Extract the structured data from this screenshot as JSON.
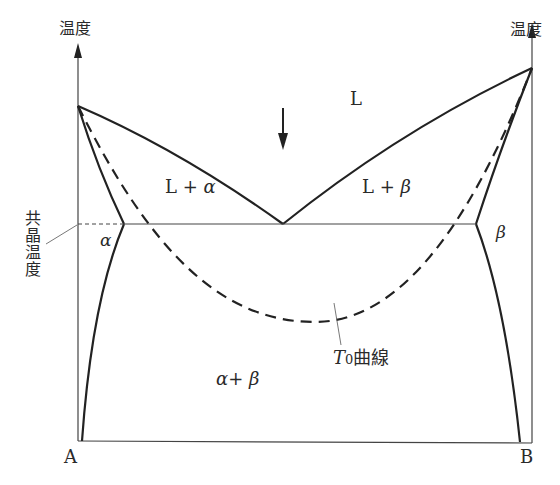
{
  "axes": {
    "left_axis_label": "温度",
    "right_axis_label": "温度",
    "left_component": "A",
    "right_component": "B"
  },
  "regions": {
    "liquid": "L",
    "liquid_alpha": "L + α",
    "liquid_beta": "L + β",
    "alpha": "α",
    "beta": "β",
    "alpha_beta": "α + β"
  },
  "annotations": {
    "eutectic_temperature": "共晶温度",
    "t0_curve": "T₀曲線",
    "t0_T": "T",
    "t0_sub": "0",
    "t0_suffix": "曲線"
  },
  "colors": {
    "line": "#222222",
    "thin_line": "#555555"
  }
}
